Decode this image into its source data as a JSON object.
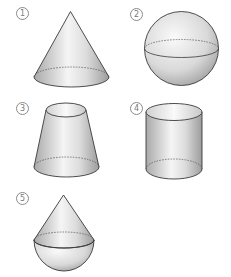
{
  "figure": {
    "items": [
      {
        "label": "1",
        "shape": "cone"
      },
      {
        "label": "2",
        "shape": "sphere"
      },
      {
        "label": "3",
        "shape": "frustum"
      },
      {
        "label": "4",
        "shape": "cylinder"
      },
      {
        "label": "5",
        "shape": "cone-on-hemisphere"
      }
    ]
  },
  "colors": {
    "stroke": "#3a3a3a",
    "fill_light": "#f4f4f4",
    "fill_mid": "#d6d6d6",
    "fill_dark": "#a8a8a8",
    "label": "#7a7a7a"
  }
}
